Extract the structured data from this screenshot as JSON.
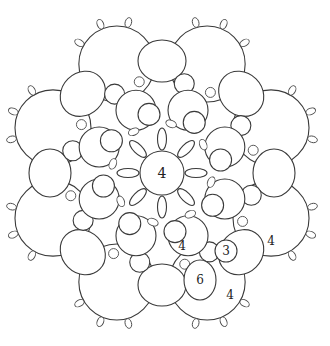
{
  "diagram": {
    "type": "tatting-pattern",
    "colors": {
      "line": "#3a3a3a",
      "background": "#ffffff",
      "label": "#222222"
    },
    "center": {
      "cx": 162,
      "cy": 173,
      "r": 22
    },
    "labels": [
      {
        "id": "center-ring",
        "text": "4",
        "x": 162,
        "y": 173,
        "size": 14
      },
      {
        "id": "inner-chain",
        "text": "4",
        "x": 182,
        "y": 246,
        "size": 12
      },
      {
        "id": "small-ring",
        "text": "3",
        "x": 226,
        "y": 251,
        "size": 12
      },
      {
        "id": "outer-chain-right",
        "text": "4",
        "x": 271,
        "y": 241,
        "size": 12
      },
      {
        "id": "large-ring",
        "text": "6",
        "x": 200,
        "y": 280,
        "size": 12
      },
      {
        "id": "outer-chain-bottom",
        "text": "4",
        "x": 230,
        "y": 295,
        "size": 12
      }
    ]
  }
}
